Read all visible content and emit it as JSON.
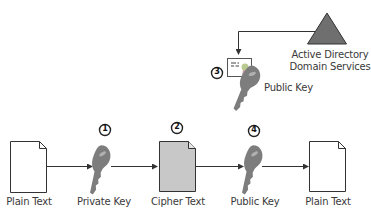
{
  "diagram": {
    "colors": {
      "key": "#7d7d7d",
      "key_highlight": "#a8a8a8",
      "cipher_fill": "#c8c8c8",
      "document_fill": "#ffffff",
      "triangle": "#707070",
      "stroke": "#333333"
    },
    "nodes": [
      {
        "id": "plain-text-1",
        "type": "document",
        "label": "Plain Text"
      },
      {
        "id": "private-key",
        "type": "key",
        "label": "Private Key",
        "step": "1"
      },
      {
        "id": "cipher-text",
        "type": "document",
        "label": "Cipher Text",
        "step": "2"
      },
      {
        "id": "public-key",
        "type": "key",
        "label": "Public Key",
        "step": "4"
      },
      {
        "id": "plain-text-2",
        "type": "document",
        "label": "Plain Text"
      },
      {
        "id": "ad-ds",
        "type": "triangle",
        "label_line1": "Active Directory",
        "label_line2": "Domain Services"
      },
      {
        "id": "certificate-public-key",
        "type": "certificate-key",
        "label": "Public Key",
        "step": "3"
      }
    ],
    "edges": [
      {
        "from": "plain-text-1",
        "to": "private-key"
      },
      {
        "from": "private-key",
        "to": "cipher-text"
      },
      {
        "from": "cipher-text",
        "to": "public-key"
      },
      {
        "from": "public-key",
        "to": "plain-text-2"
      },
      {
        "from": "ad-ds",
        "to": "certificate-public-key"
      }
    ],
    "step_badges": {
      "1": "1",
      "2": "2",
      "3": "3",
      "4": "4"
    }
  }
}
